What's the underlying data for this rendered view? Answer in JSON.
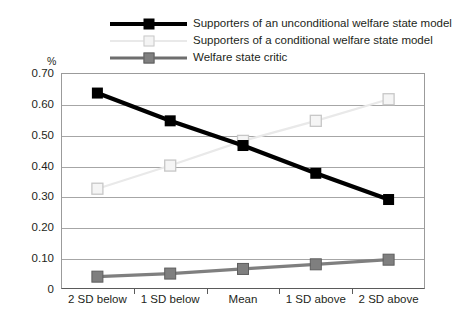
{
  "legend": {
    "items": [
      {
        "label": "Supporters of an unconditional welfare state model",
        "key": "black-square-key",
        "color": "#000000"
      },
      {
        "label": "Supporters of a conditional welfare state model",
        "key": "light-square-key",
        "color": "#e9e9e9"
      },
      {
        "label": "Welfare state critic",
        "key": "gray-square-key",
        "color": "#7f7f7f"
      }
    ]
  },
  "axis": {
    "y_title": "%",
    "y_ticks": [
      "0.70",
      "0.60",
      "0.50",
      "0.40",
      "0.30",
      "0.20",
      "0.10",
      "0"
    ]
  },
  "chart_data": {
    "type": "line",
    "title": "",
    "xlabel": "",
    "ylabel": "%",
    "categories": [
      "2 SD below",
      "1 SD below",
      "Mean",
      "1 SD above",
      "2 SD above"
    ],
    "ylim": [
      0,
      0.7
    ],
    "ytick_values": [
      0.7,
      0.6,
      0.5,
      0.4,
      0.3,
      0.2,
      0.1,
      0
    ],
    "grid": true,
    "legend_position": "top",
    "series": [
      {
        "name": "Supporters of an unconditional welfare state model",
        "color": "#000000",
        "marker": "filled-square",
        "values": [
          0.635,
          0.545,
          0.465,
          0.375,
          0.29
        ]
      },
      {
        "name": "Supporters of a conditional welfare state model",
        "color": "#e9e9e9",
        "marker": "open-square",
        "values": [
          0.325,
          0.4,
          0.48,
          0.545,
          0.615
        ]
      },
      {
        "name": "Welfare state critic",
        "color": "#7f7f7f",
        "marker": "filled-square",
        "values": [
          0.04,
          0.05,
          0.065,
          0.08,
          0.095
        ]
      }
    ]
  }
}
